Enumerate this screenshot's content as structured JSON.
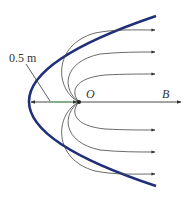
{
  "diagram": {
    "labels": {
      "distance": "0.5 m",
      "focus": "O",
      "field": "B"
    },
    "colors": {
      "reflector": "#1f2f7a",
      "field_lines": "#444444",
      "axis": "#333333",
      "dimension_highlight": "#5fbf6f",
      "text": "#333333"
    },
    "reflector": {
      "shape": "parabola",
      "vertex": [
        29,
        102
      ],
      "top_end": [
        156,
        16
      ],
      "bottom_end": [
        156,
        186
      ]
    },
    "focus_point": [
      79,
      102
    ],
    "field_line_arrow_y": [
      30,
      52,
      74,
      130,
      152,
      174
    ],
    "axis_end_x": 181
  }
}
